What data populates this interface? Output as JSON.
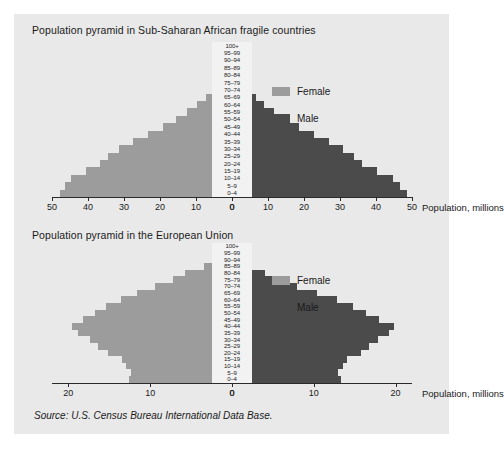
{
  "figure": {
    "source_note": "Source: U.S. Census Bureau International Data Base.",
    "colors": {
      "female": "#9c9c9c",
      "male": "#4b4b4b",
      "panel_background": "#e9e9e9",
      "axis": "#2a2a2a",
      "text": "#1a1a1a"
    }
  },
  "legend": {
    "female_label": "Female",
    "male_label": "Male"
  },
  "chart_data": [
    {
      "type": "bar",
      "subtype": "population-pyramid",
      "title": "Population pyramid in Sub-Saharan African fragile countries",
      "xlabel": "Population, millions",
      "ylabel": "",
      "xlim": [
        0,
        50
      ],
      "xticks": [
        50,
        40,
        30,
        20,
        10,
        0,
        0,
        10,
        20,
        30,
        40,
        50
      ],
      "left_ticks": [
        50,
        40,
        30,
        20,
        10,
        0
      ],
      "right_ticks": [
        0,
        10,
        20,
        30,
        40,
        50
      ],
      "grid": false,
      "legend_position": "right",
      "categories": [
        "100+",
        "95–99",
        "90–94",
        "85–89",
        "80–84",
        "75–79",
        "70–74",
        "65–69",
        "60–64",
        "55–59",
        "50–54",
        "45–49",
        "40–44",
        "35–39",
        "30–34",
        "25–29",
        "20–24",
        "15–19",
        "10–14",
        "5–9",
        "0–4"
      ],
      "series": [
        {
          "name": "Female",
          "side": "left",
          "values": [
            0.1,
            0.3,
            0.7,
            1.4,
            2.4,
            3.6,
            5.2,
            7.2,
            9.6,
            12.4,
            15.6,
            19.2,
            23.4,
            27.6,
            31.4,
            34.4,
            36.6,
            40.6,
            44.6,
            46.4,
            47.8
          ]
        },
        {
          "name": "Male",
          "side": "right",
          "values": [
            0.1,
            0.2,
            0.5,
            1.1,
            2.0,
            3.2,
            4.7,
            6.6,
            9.0,
            11.8,
            15.0,
            18.6,
            22.8,
            27.0,
            30.8,
            33.8,
            36.2,
            40.4,
            44.6,
            46.8,
            48.6
          ]
        }
      ]
    },
    {
      "type": "bar",
      "subtype": "population-pyramid",
      "title": "Population pyramid in the European Union",
      "xlabel": "Population, millions",
      "ylabel": "",
      "xlim": [
        0,
        22
      ],
      "xticks": [
        20,
        10,
        0,
        0,
        10,
        20
      ],
      "left_ticks": [
        20,
        10,
        0
      ],
      "right_ticks": [
        0,
        10,
        20
      ],
      "grid": false,
      "legend_position": "right",
      "categories": [
        "100+",
        "95–99",
        "90–94",
        "85–89",
        "80–84",
        "75–79",
        "70–74",
        "65–69",
        "60–64",
        "55–59",
        "50–54",
        "45–49",
        "40–44",
        "35–39",
        "30–34",
        "25–29",
        "20–24",
        "15–19",
        "10–14",
        "5–9",
        "0–4"
      ],
      "series": [
        {
          "name": "Female",
          "side": "left",
          "values": [
            0.1,
            0.6,
            1.7,
            3.4,
            5.8,
            7.2,
            9.4,
            11.6,
            13.6,
            15.4,
            16.8,
            18.2,
            19.6,
            18.8,
            17.4,
            16.4,
            15.2,
            13.4,
            13.0,
            12.4,
            12.6
          ]
        },
        {
          "name": "Male",
          "side": "right",
          "values": [
            0.05,
            0.3,
            0.9,
            2.0,
            4.0,
            5.6,
            8.0,
            10.4,
            12.8,
            14.8,
            16.4,
            18.0,
            19.8,
            19.2,
            17.8,
            16.8,
            15.8,
            14.0,
            13.6,
            13.0,
            13.3
          ]
        }
      ]
    }
  ]
}
